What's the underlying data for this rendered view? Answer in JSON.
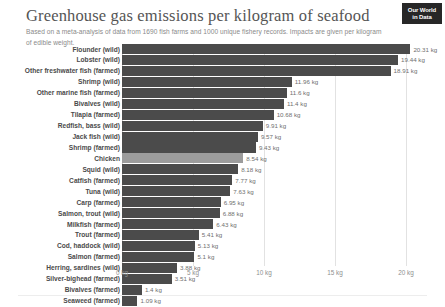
{
  "header": {
    "title": "Greenhouse gas emissions per kilogram of seafood",
    "subtitle": "Based on a meta-analysis of data from 1690 fish farms and 1000 unique fishery records. Impacts are given per kilogram of edible weight.",
    "logo_line1": "Our World",
    "logo_line2": "in Data"
  },
  "colors": {
    "bar": "#4b4b4b",
    "bar_highlight": "#9c9c9c",
    "gridline": "#e2e2e2",
    "title_text": "#555555",
    "subtitle_text": "#8a8a8a",
    "label_text": "#4a4a4a",
    "value_text": "#6f6f6f",
    "axis_text": "#8f8f8f",
    "logo_background": "#272727"
  },
  "chart_data": {
    "type": "bar",
    "orientation": "horizontal",
    "title": "Greenhouse gas emissions per kilogram of seafood",
    "subtitle": "Based on a meta-analysis of data from 1690 fish farms and 1000 unique fishery records. Impacts are given per kilogram of edible weight.",
    "xlabel": "",
    "ylabel": "",
    "unit": "kg",
    "xlim": [
      0,
      20.31
    ],
    "grid": true,
    "legend": false,
    "xticks": [
      0,
      5,
      10,
      15,
      20
    ],
    "xtick_labels": [
      "0 kg",
      "5 kg",
      "10 kg",
      "15 kg",
      "20 kg"
    ],
    "categories": [
      "Flounder (wild)",
      "Lobster (wild)",
      "Other freshwater fish (farmed)",
      "Shrimp (wild)",
      "Other marine fish (farmed)",
      "Bivalves (wild)",
      "Tilapia (farmed)",
      "Redfish, bass (wild)",
      "Jack fish (wild)",
      "Shrimp (farmed)",
      "Chicken",
      "Squid (wild)",
      "Catfish (farmed)",
      "Tuna (wild)",
      "Carp (farmed)",
      "Salmon, trout (wild)",
      "Milkfish (farmed)",
      "Trout (farmed)",
      "Cod, haddock (wild)",
      "Salmon (farmed)",
      "Herring, sardines (wild)",
      "Silver-bighead (farmed)",
      "Bivalves (farmed)",
      "Seaweed (farmed)"
    ],
    "values": [
      20.31,
      19.44,
      18.91,
      11.96,
      11.6,
      11.4,
      10.68,
      9.91,
      9.57,
      9.43,
      8.54,
      8.18,
      7.77,
      7.63,
      6.95,
      6.88,
      6.43,
      5.41,
      5.13,
      5.1,
      3.88,
      3.51,
      1.4,
      1.09
    ],
    "value_labels": [
      "20.31 kg",
      "19.44 kg",
      "18.91 kg",
      "11.96 kg",
      "11.6 kg",
      "11.4 kg",
      "10.68 kg",
      "9.91 kg",
      "9.57 kg",
      "9.43 kg",
      "8.54 kg",
      "8.18 kg",
      "7.77 kg",
      "7.63 kg",
      "6.95 kg",
      "6.88 kg",
      "6.43 kg",
      "5.41 kg",
      "5.13 kg",
      "5.1 kg",
      "3.88 kg",
      "3.51 kg",
      "1.4 kg",
      "1.09 kg"
    ],
    "highlighted_categories": [
      "Chicken"
    ]
  }
}
